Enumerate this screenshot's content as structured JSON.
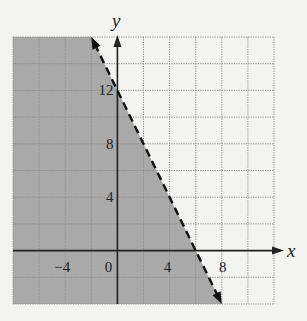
{
  "chart_data": {
    "type": "inequality-graph",
    "title": "",
    "xlabel": "x",
    "ylabel": "y",
    "xlim": [
      -8,
      12
    ],
    "ylim": [
      -4,
      16
    ],
    "grid": true,
    "grid_step": 2,
    "x_tick_labels": [
      "-4",
      "0",
      "4",
      "8"
    ],
    "x_ticks": [
      -4,
      0,
      4,
      8
    ],
    "y_tick_labels": [
      "4",
      "8",
      "12"
    ],
    "y_ticks": [
      4,
      8,
      12
    ],
    "boundary_line": {
      "equation": "y = -2x + 12",
      "style": "dashed",
      "points": [
        [
          -2,
          16
        ],
        [
          8,
          -4
        ]
      ],
      "y_intercept": 12,
      "x_intercept": 6
    },
    "shaded_region": "y < -2x + 12",
    "shade_side": "left/below",
    "colors": {
      "shade": "#a9a9a9",
      "grid": "#8a8a8a",
      "axis": "#222222",
      "background": "#f3f3f1"
    }
  }
}
